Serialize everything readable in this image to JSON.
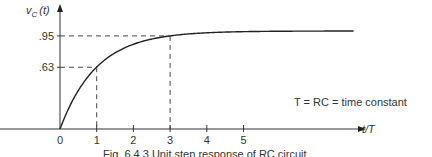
{
  "chart_data": {
    "type": "line",
    "title": "",
    "caption": "Fig. 6.4.3 Unit step response of RC circuit",
    "ylabel": "v_C(t)",
    "ylabel_main": "v",
    "ylabel_sub": "C",
    "ylabel_arg": "(t)",
    "xlabel": "t/T",
    "xlim": [
      0,
      8.0
    ],
    "ylim": [
      0,
      1.05
    ],
    "x_ticks": [
      0,
      1,
      2,
      3,
      4,
      5
    ],
    "x_tick_labels": [
      "0",
      "1",
      "2",
      "3",
      "4",
      "5"
    ],
    "y_ticks": [
      0.63,
      0.95
    ],
    "y_tick_labels": [
      ".63",
      ".95"
    ],
    "grid": false,
    "series": [
      {
        "name": "v_C(t) = 1 - e^(-t/T)",
        "function": "1 - exp(-x)",
        "x_range": [
          0,
          8.0
        ]
      }
    ],
    "guides": [
      {
        "x": 1,
        "y": 0.63
      },
      {
        "x": 3,
        "y": 0.95
      }
    ],
    "annotation": "T = RC = time constant"
  }
}
